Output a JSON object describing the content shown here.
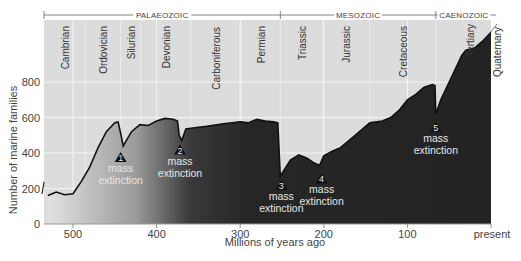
{
  "chart_data": {
    "type": "area",
    "title": "",
    "xlabel": "Millions of years ago",
    "ylabel": "Number of marine families",
    "xlim": [
      535,
      0
    ],
    "ylim": [
      0,
      1150
    ],
    "x_ticks": [
      {
        "value": 500,
        "label": "500"
      },
      {
        "value": 400,
        "label": "400"
      },
      {
        "value": 300,
        "label": "300"
      },
      {
        "value": 200,
        "label": "200"
      },
      {
        "value": 100,
        "label": "100"
      },
      {
        "value": 0,
        "label": "present"
      }
    ],
    "y_ticks": [
      {
        "value": 0,
        "label": "0"
      },
      {
        "value": 200,
        "label": "200"
      },
      {
        "value": 400,
        "label": "400"
      },
      {
        "value": 600,
        "label": "600"
      },
      {
        "value": 800,
        "label": "800"
      }
    ],
    "grid": true,
    "series": [
      {
        "name": "Number of marine families",
        "x": [
          530,
          520,
          510,
          500,
          490,
          480,
          470,
          460,
          450,
          446,
          443,
          440,
          435,
          430,
          420,
          410,
          400,
          390,
          380,
          375,
          373,
          370,
          365,
          350,
          340,
          320,
          300,
          290,
          280,
          270,
          260,
          255,
          252,
          248,
          240,
          230,
          220,
          212,
          205,
          200,
          190,
          180,
          170,
          160,
          150,
          145,
          130,
          120,
          110,
          100,
          90,
          80,
          70,
          67,
          66,
          60,
          50,
          40,
          35,
          30,
          20,
          10,
          0
        ],
        "y": [
          160,
          180,
          165,
          170,
          240,
          320,
          430,
          520,
          570,
          575,
          510,
          440,
          480,
          520,
          560,
          555,
          580,
          595,
          590,
          580,
          500,
          470,
          535,
          545,
          550,
          565,
          575,
          570,
          590,
          580,
          575,
          570,
          270,
          300,
          360,
          390,
          370,
          345,
          330,
          385,
          410,
          430,
          470,
          510,
          550,
          570,
          580,
          600,
          640,
          700,
          730,
          770,
          785,
          780,
          620,
          700,
          800,
          900,
          950,
          980,
          990,
          1030,
          1080
        ]
      }
    ],
    "eras": [
      {
        "name": "PALAEOZOIC",
        "start": 541,
        "end": 252
      },
      {
        "name": "MESOZOIC",
        "start": 252,
        "end": 66
      },
      {
        "name": "CAENOZOIC",
        "start": 66,
        "end": 0
      }
    ],
    "periods": [
      {
        "name": "Cambrian",
        "start": 541,
        "end": 485
      },
      {
        "name": "Ordovician",
        "start": 485,
        "end": 443
      },
      {
        "name": "Silurian",
        "start": 443,
        "end": 419
      },
      {
        "name": "Devonian",
        "start": 419,
        "end": 359
      },
      {
        "name": "Carboniferous",
        "start": 359,
        "end": 299
      },
      {
        "name": "Permian",
        "start": 299,
        "end": 252
      },
      {
        "name": "Triassic",
        "start": 252,
        "end": 201
      },
      {
        "name": "Jurassic",
        "start": 201,
        "end": 145
      },
      {
        "name": "Cretaceous",
        "start": 145,
        "end": 66
      },
      {
        "name": "Tertiary",
        "start": 66,
        "end": 2.6
      },
      {
        "name": "Quaternary",
        "start": 2.6,
        "end": 0
      }
    ],
    "annotations": [
      {
        "number": "1",
        "text": [
          "mass",
          "extinction"
        ],
        "x": 443,
        "y": 440
      },
      {
        "number": "2",
        "text": [
          "mass",
          "extinction"
        ],
        "x": 372,
        "y": 470
      },
      {
        "number": "3",
        "text": [
          "mass",
          "extinction"
        ],
        "x": 252,
        "y": 270
      },
      {
        "number": "4",
        "text": [
          "mass",
          "extinction"
        ],
        "x": 205,
        "y": 330
      },
      {
        "number": "5",
        "text": [
          "mass",
          "extinction"
        ],
        "x": 66,
        "y": 620
      }
    ],
    "legend": null
  }
}
